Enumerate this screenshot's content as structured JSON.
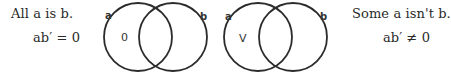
{
  "left_caption": {
    "statement": "All a is b.",
    "formula": "ab′ = 0"
  },
  "right_caption": {
    "statement": "Some a isn't b.",
    "formula": "ab′ ≠ 0"
  },
  "diagrams": [
    {
      "circles": [
        {
          "label": "a",
          "cx": 138,
          "cy": 37,
          "r": 34
        },
        {
          "label": "b",
          "cx": 173,
          "cy": 37,
          "r": 34
        }
      ],
      "region_mark": "0",
      "region": "a-only"
    },
    {
      "circles": [
        {
          "label": "a",
          "cx": 258,
          "cy": 37,
          "r": 34
        },
        {
          "label": "b",
          "cx": 293,
          "cy": 37,
          "r": 34
        }
      ],
      "region_mark": "V",
      "region": "a-only"
    }
  ],
  "colors": {
    "stroke": "#2b2b2b",
    "text": "#2a2a2a"
  }
}
